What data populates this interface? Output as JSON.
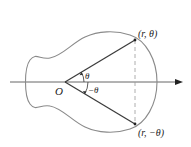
{
  "diagram": {
    "labels": {
      "origin": "O",
      "point_upper": "(r, θ)",
      "point_lower": "(r, −θ)",
      "angle_upper": "θ",
      "angle_lower": "−θ"
    },
    "colors": {
      "curve": "#8a8a8a",
      "rays": "#3a3a3a",
      "axis": "#555555",
      "dashed": "#9a9a9a",
      "background": "#ffffff"
    },
    "geometry": {
      "origin": [
        65,
        82
      ],
      "point_upper": [
        135,
        40
      ],
      "point_lower": [
        135,
        124
      ],
      "axis_start_x": 10,
      "axis_end_x": 183
    }
  }
}
